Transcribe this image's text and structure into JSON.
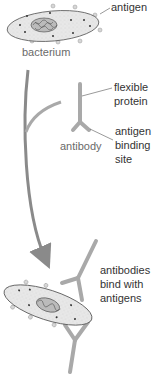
{
  "diagram": {
    "labels": {
      "antigen": "antigen",
      "bacterium": "bacterium",
      "flexible_protein_line1": "flexible",
      "flexible_protein_line2": "protein",
      "antibody": "antibody",
      "binding_site_line1": "antigen",
      "binding_site_line2": "binding",
      "binding_site_line3": "site",
      "bind_line1": "antibodies",
      "bind_line2": "bind with",
      "bind_line3": "antigens"
    },
    "colors": {
      "antibody": "#a9a9a9",
      "arrow": "#8a8a8a",
      "bacterium_fill": "#e6e6e6",
      "bacterium_outline": "#555555",
      "text": "#333333"
    }
  }
}
